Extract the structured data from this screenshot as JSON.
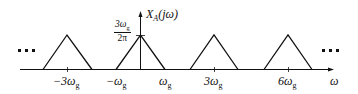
{
  "diagram": {
    "type": "spectrum-plot",
    "y_axis_label": "X_A(jω)",
    "y_axis_label_main": "X",
    "y_axis_label_sub": "A",
    "y_axis_label_arg": "(jω)",
    "x_axis_label": "ω",
    "peak_value_numerator": "3ω",
    "peak_value_numerator_sub": "g",
    "peak_value_denominator": "2π",
    "tick_labels": [
      {
        "main": "−3ω",
        "sub": "g"
      },
      {
        "main": "−ω",
        "sub": "g"
      },
      {
        "main": "ω",
        "sub": "g"
      },
      {
        "main": "3ω",
        "sub": "g"
      },
      {
        "main": "6ω",
        "sub": "g"
      }
    ],
    "ellipsis_left": "• • •",
    "ellipsis_right": "• • •",
    "triangles": [
      {
        "center": "-3ωg",
        "left": "-4ωg",
        "right": "-2ωg"
      },
      {
        "center": "0",
        "left": "-ωg",
        "right": "ωg"
      },
      {
        "center": "3ωg",
        "left": "2ωg",
        "right": "4ωg"
      },
      {
        "center": "6ωg",
        "left": "5ωg",
        "right": "7ωg"
      }
    ],
    "line_color": "#111111"
  }
}
